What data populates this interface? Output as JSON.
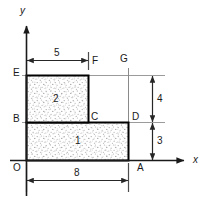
{
  "figure": {
    "type": "geometry-diagram",
    "axes": {
      "x_label": "x",
      "y_label": "y",
      "origin_label": "O"
    },
    "points": [
      {
        "name": "O",
        "label": "O"
      },
      {
        "name": "A",
        "label": "A"
      },
      {
        "name": "B",
        "label": "B"
      },
      {
        "name": "C",
        "label": "C"
      },
      {
        "name": "D",
        "label": "D"
      },
      {
        "name": "E",
        "label": "E"
      },
      {
        "name": "F",
        "label": "F"
      },
      {
        "name": "G",
        "label": "G"
      }
    ],
    "regions": [
      {
        "name": "region-1",
        "label": "1"
      },
      {
        "name": "region-2",
        "label": "2"
      }
    ],
    "dimensions": [
      {
        "name": "top-width",
        "label": "5",
        "orientation": "horizontal"
      },
      {
        "name": "bottom-width",
        "label": "8",
        "orientation": "horizontal"
      },
      {
        "name": "upper-height",
        "label": "4",
        "orientation": "vertical"
      },
      {
        "name": "lower-height",
        "label": "3",
        "orientation": "vertical"
      }
    ],
    "colors": {
      "outline": "#000000",
      "axis": "#1a1a1a",
      "dimension_line": "#4d4d4d",
      "extension_line": "#808080",
      "fill_stipple": "#9a9a9a",
      "background": "#ffffff"
    }
  }
}
